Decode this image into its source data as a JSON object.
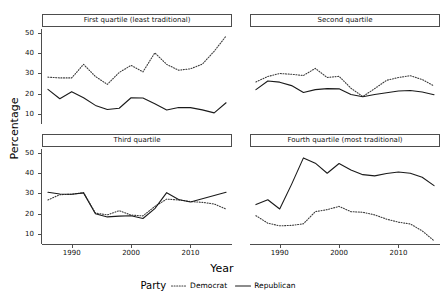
{
  "figure": {
    "ylabel": "Percentage",
    "xlabel": "Year",
    "legend_title": "Party"
  },
  "legend": {
    "items": [
      {
        "label": "Democrat",
        "style": "dotted",
        "color": "#3c3c3c"
      },
      {
        "label": "Republican",
        "style": "solid",
        "color": "#1a1a1a"
      }
    ]
  },
  "axes": {
    "y_ticks": [
      10,
      20,
      30,
      40,
      50
    ],
    "x_ticks": [
      1990,
      2000,
      2010
    ],
    "ylim": [
      5,
      52
    ],
    "xlim": [
      1985,
      2017
    ]
  },
  "panels": [
    {
      "key": "p1",
      "title": "First quartile (least traditional)"
    },
    {
      "key": "p2",
      "title": "Second quartile"
    },
    {
      "key": "p3",
      "title": "Third quartile"
    },
    {
      "key": "p4",
      "title": "Fourth quartile (most traditional)"
    }
  ],
  "chart_data": {
    "type": "line",
    "title": "",
    "xlabel": "Year",
    "ylabel": "Percentage",
    "xlim": [
      1985,
      2017
    ],
    "ylim": [
      5,
      52
    ],
    "grid": false,
    "legend_position": "bottom",
    "legend_title": "Party",
    "x": [
      1986,
      1988,
      1990,
      1992,
      1994,
      1996,
      1998,
      2000,
      2002,
      2004,
      2006,
      2008,
      2010,
      2012,
      2014,
      2016
    ],
    "facets": [
      {
        "name": "First quartile (least traditional)",
        "series": [
          {
            "name": "Democrat",
            "style": "dotted",
            "values": [
              28.2,
              27.8,
              27.8,
              34.5,
              28.5,
              24.6,
              30.5,
              34.0,
              30.8,
              40.2,
              34.5,
              31.6,
              32.3,
              34.6,
              41.0,
              48.5
            ]
          },
          {
            "name": "Republican",
            "style": "solid",
            "values": [
              22.1,
              17.5,
              21.0,
              18.0,
              14.2,
              12.2,
              12.8,
              18.0,
              17.9,
              15.0,
              11.9,
              13.2,
              13.1,
              12.0,
              10.5,
              15.5
            ]
          }
        ]
      },
      {
        "name": "Second quartile",
        "series": [
          {
            "name": "Democrat",
            "style": "dotted",
            "values": [
              25.8,
              28.5,
              30.0,
              29.6,
              29.0,
              32.5,
              28.0,
              28.6,
              22.7,
              18.6,
              22.5,
              26.6,
              28.0,
              28.9,
              27.0,
              23.8
            ]
          },
          {
            "name": "Republican",
            "style": "solid",
            "values": [
              22.0,
              26.3,
              25.7,
              24.0,
              20.6,
              22.0,
              22.5,
              22.4,
              19.6,
              18.5,
              19.6,
              20.5,
              21.3,
              21.6,
              20.8,
              19.5
            ]
          }
        ]
      },
      {
        "name": "Third quartile",
        "series": [
          {
            "name": "Democrat",
            "style": "dotted",
            "values": [
              26.8,
              29.4,
              29.6,
              30.4,
              20.3,
              19.4,
              21.5,
              19.3,
              18.9,
              23.6,
              27.2,
              26.8,
              26.0,
              25.6,
              24.8,
              22.3
            ]
          },
          {
            "name": "Republican",
            "style": "solid",
            "values": [
              30.6,
              29.7,
              29.6,
              30.3,
              20.0,
              18.4,
              18.8,
              19.0,
              17.6,
              22.5,
              30.4,
              27.0,
              25.8,
              27.4,
              29.0,
              30.6
            ]
          }
        ]
      },
      {
        "name": "Fourth quartile (most traditional)",
        "series": [
          {
            "name": "Democrat",
            "style": "dotted",
            "values": [
              19.0,
              15.3,
              14.0,
              14.2,
              15.0,
              21.0,
              22.0,
              23.6,
              21.0,
              20.7,
              19.4,
              17.3,
              15.8,
              14.9,
              11.5,
              6.6
            ]
          },
          {
            "name": "Republican",
            "style": "solid",
            "values": [
              24.5,
              26.9,
              22.3,
              34.5,
              47.6,
              45.0,
              40.0,
              44.8,
              41.6,
              39.3,
              38.7,
              39.9,
              40.6,
              40.0,
              38.0,
              33.9
            ]
          }
        ]
      }
    ]
  }
}
